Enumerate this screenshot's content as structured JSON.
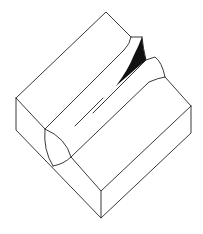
{
  "diagram": {
    "type": "isometric-line-drawing",
    "colors": {
      "background": "#ffffff",
      "line": "#3a3a3a",
      "shadow": "#111111"
    }
  }
}
